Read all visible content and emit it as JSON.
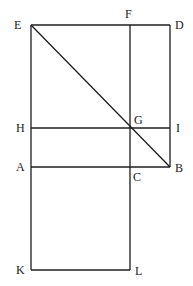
{
  "diagram": {
    "type": "geometric-construction",
    "stroke_color": "#1e1e1e",
    "label_color": "#222222",
    "points": {
      "E": {
        "x": 31,
        "y": 25
      },
      "F": {
        "x": 130,
        "y": 25
      },
      "D": {
        "x": 170,
        "y": 25
      },
      "H": {
        "x": 31,
        "y": 128
      },
      "G": {
        "x": 130,
        "y": 128
      },
      "I": {
        "x": 170,
        "y": 128
      },
      "A": {
        "x": 31,
        "y": 167
      },
      "C": {
        "x": 130,
        "y": 167
      },
      "B": {
        "x": 170,
        "y": 167
      },
      "K": {
        "x": 31,
        "y": 270
      },
      "L": {
        "x": 130,
        "y": 270
      }
    },
    "labels": {
      "E": "E",
      "F": "F",
      "D": "D",
      "H": "H",
      "G": "G",
      "I": "I",
      "A": "A",
      "C": "C",
      "B": "B",
      "K": "K",
      "L": "L"
    },
    "segments": [
      [
        "E",
        "D"
      ],
      [
        "D",
        "B"
      ],
      [
        "E",
        "K"
      ],
      [
        "F",
        "L"
      ],
      [
        "H",
        "I"
      ],
      [
        "A",
        "B"
      ],
      [
        "K",
        "L"
      ],
      [
        "E",
        "B"
      ]
    ]
  }
}
